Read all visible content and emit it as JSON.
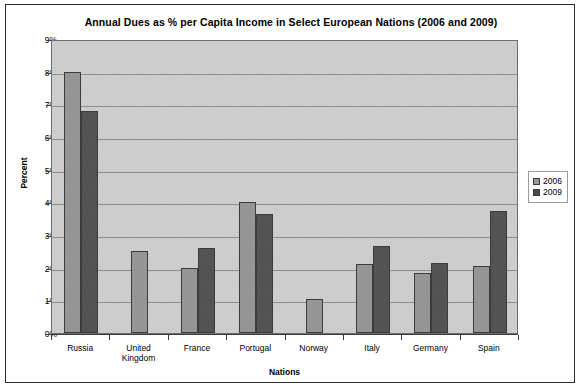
{
  "chart_data": {
    "type": "bar",
    "title": "Annual Dues as % per Capita Income in Select European Nations (2006 and 2009)",
    "xlabel": "Nations",
    "ylabel": "Percent",
    "categories": [
      "Russia",
      "United Kingdom",
      "France",
      "Portugal",
      "Norway",
      "Italy",
      "Germany",
      "Spain"
    ],
    "category_lines": [
      [
        "Russia"
      ],
      [
        "United",
        "Kingdom"
      ],
      [
        "France"
      ],
      [
        "Portugal"
      ],
      [
        "Norway"
      ],
      [
        "Italy"
      ],
      [
        "Germany"
      ],
      [
        "Spain"
      ]
    ],
    "series": [
      {
        "name": "2006",
        "color": "#9a9a9a",
        "values": [
          8.0,
          2.5,
          2.0,
          4.0,
          1.05,
          2.1,
          1.85,
          2.05
        ]
      },
      {
        "name": "2009",
        "color": "#585858",
        "values": [
          6.8,
          null,
          2.6,
          3.63,
          null,
          2.65,
          2.15,
          3.75
        ]
      }
    ],
    "ylim": [
      0,
      9
    ],
    "ytick_labels": [
      "0%",
      "1%",
      "2%",
      "3%",
      "4%",
      "5%",
      "6%",
      "7%",
      "8%",
      "9%"
    ],
    "ytick_values": [
      0,
      1,
      2,
      3,
      4,
      5,
      6,
      7,
      8,
      9
    ],
    "grid": true,
    "legend_position": "right",
    "plot_background": "#d2d2d2",
    "frame_border": "#2b2b2b"
  }
}
